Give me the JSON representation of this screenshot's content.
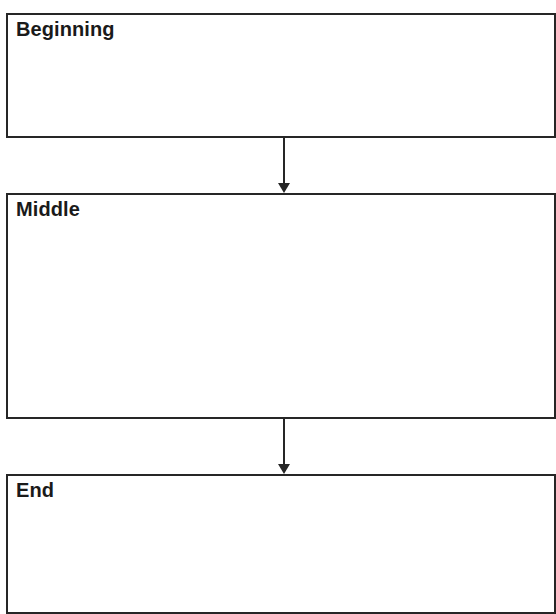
{
  "diagram": {
    "type": "flowchart",
    "direction": "top-to-bottom",
    "boxes": [
      {
        "id": "beginning",
        "label": "Beginning"
      },
      {
        "id": "middle",
        "label": "Middle"
      },
      {
        "id": "end",
        "label": "End"
      }
    ],
    "arrows": [
      {
        "from": "beginning",
        "to": "middle"
      },
      {
        "from": "middle",
        "to": "end"
      }
    ],
    "colors": {
      "border": "#262626",
      "text": "#1a1a1a",
      "background": "#ffffff"
    }
  }
}
